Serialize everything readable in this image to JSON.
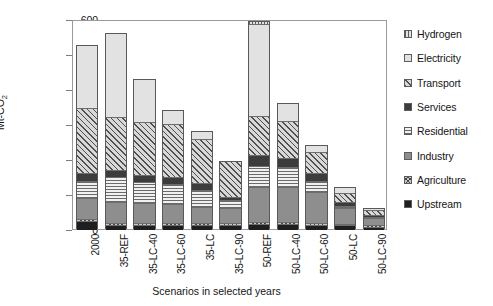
{
  "chart_data": {
    "type": "bar",
    "title": "",
    "subtitle": "",
    "xlabel": "Scenarios in selected years",
    "ylabel": "Mt-CO2",
    "ylabel_display": "Mt-CO",
    "ylabel_sub": "2",
    "ylim": [
      0,
      600
    ],
    "yticks": [
      0,
      100,
      200,
      300,
      400,
      500,
      600
    ],
    "grid": false,
    "stacked": true,
    "legend_position": "right",
    "categories": [
      "2000",
      "35-REF",
      "35-LC-40",
      "35-LC-60",
      "35-LC",
      "35-LC-90",
      "50-REF",
      "50-LC-40",
      "50-LC-60",
      "50-LC",
      "50-LC-90"
    ],
    "series": [
      {
        "name": "Upstream",
        "color": "#1f1f1f",
        "pattern": "solid-dark",
        "values": [
          22,
          12,
          12,
          12,
          12,
          12,
          14,
          13,
          12,
          10,
          6
        ]
      },
      {
        "name": "Agriculture",
        "color": "#c9c9c9",
        "pattern": "crosshatch",
        "values": [
          6,
          6,
          6,
          6,
          6,
          6,
          6,
          6,
          6,
          5,
          4
        ]
      },
      {
        "name": "Industry",
        "color": "#8e8e8e",
        "pattern": "solid-mid-gray",
        "values": [
          62,
          60,
          56,
          53,
          44,
          42,
          101,
          101,
          87,
          44,
          20
        ]
      },
      {
        "name": "Residential",
        "color": "#f0f0f0",
        "pattern": "horizontal-lines",
        "values": [
          48,
          70,
          60,
          57,
          49,
          22,
          60,
          56,
          33,
          7,
          4
        ]
      },
      {
        "name": "Services",
        "color": "#3c3c3c",
        "pattern": "solid-dark-gray",
        "values": [
          23,
          22,
          20,
          21,
          20,
          9,
          30,
          28,
          22,
          11,
          5
        ]
      },
      {
        "name": "Transport",
        "color": "#d8d8d8",
        "pattern": "diagonal-hatch",
        "values": [
          186,
          150,
          153,
          151,
          126,
          103,
          111,
          106,
          60,
          27,
          16
        ]
      },
      {
        "name": "Electricity",
        "color": "#e2e2e2",
        "pattern": "solid-light",
        "values": [
          180,
          240,
          123,
          40,
          23,
          0,
          265,
          50,
          20,
          17,
          4
        ]
      },
      {
        "name": "Hydrogen",
        "color": "#e3e3e3",
        "pattern": "vertical-lines",
        "values": [
          0,
          0,
          0,
          0,
          0,
          0,
          6,
          0,
          0,
          0,
          0
        ]
      }
    ],
    "totals": [
      527,
      560,
      430,
      340,
      280,
      194,
      593,
      360,
      240,
      121,
      59
    ]
  },
  "legend": {
    "items": [
      {
        "label": "Hydrogen",
        "pattern_class": "p-hydrogen"
      },
      {
        "label": "Electricity",
        "pattern_class": "p-electricity"
      },
      {
        "label": "Transport",
        "pattern_class": "p-transport"
      },
      {
        "label": "Services",
        "pattern_class": "p-services"
      },
      {
        "label": "Residential",
        "pattern_class": "p-residential"
      },
      {
        "label": "Industry",
        "pattern_class": "p-industry"
      },
      {
        "label": "Agriculture",
        "pattern_class": "p-agriculture"
      },
      {
        "label": "Upstream",
        "pattern_class": "p-upstream"
      }
    ]
  }
}
